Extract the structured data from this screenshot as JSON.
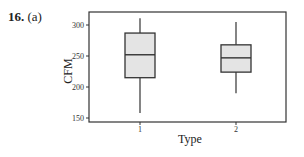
{
  "problem": {
    "number": "16.",
    "part": "(a)"
  },
  "chart_data": {
    "type": "box",
    "title": "",
    "xlabel": "Type",
    "ylabel": "CFM",
    "categories": [
      "1",
      "2"
    ],
    "ylim": [
      150,
      320
    ],
    "yticks": [
      150,
      200,
      250,
      300
    ],
    "grid": false,
    "boxes": [
      {
        "category": "1",
        "min": 158,
        "q1": 215,
        "median": 252,
        "q3": 287,
        "max": 311
      },
      {
        "category": "2",
        "min": 190,
        "q1": 224,
        "median": 247,
        "q3": 268,
        "max": 305
      }
    ],
    "colors": {
      "box_fill": "#e4e4e4",
      "line": "#333333"
    }
  }
}
